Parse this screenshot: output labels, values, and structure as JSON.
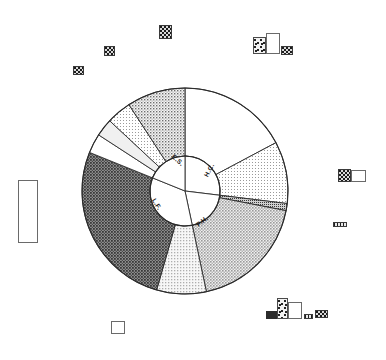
{
  "figure": {
    "title": "",
    "center": {
      "x": 185,
      "y": 191
    },
    "outer_radius": 103,
    "inner_radius": 35
  },
  "chart_data": {
    "type": "pie",
    "title": "",
    "xlabel": "",
    "ylabel": "",
    "legend_position": "none",
    "grid": false,
    "inner_ring": {
      "name": "inner",
      "labels": [
        "H.C.",
        "P.H.",
        "L.F.",
        "E.S."
      ],
      "start_angles_deg": [
        0,
        97,
        168,
        292
      ],
      "end_angles_deg": [
        97,
        168,
        292,
        360
      ],
      "values": [
        27,
        20,
        34,
        19
      ],
      "fills": [
        "white",
        "white",
        "white",
        "white"
      ],
      "label_positions": [
        {
          "label": "H.C.",
          "x": 209,
          "y": 170,
          "rotate": -62
        },
        {
          "label": "P.H.",
          "x": 202,
          "y": 221,
          "rotate": -38
        },
        {
          "label": "L.F.",
          "x": 157,
          "y": 204,
          "rotate": 58
        },
        {
          "label": "E.S.",
          "x": 178,
          "y": 160,
          "rotate": 42
        }
      ]
    },
    "outer_ring": {
      "name": "outer",
      "segments": [
        {
          "id": "hc-1",
          "parent": "H.C.",
          "start_angle_deg": 0,
          "end_angle_deg": 62,
          "value": 17,
          "fill": "white"
        },
        {
          "id": "hc-2",
          "parent": "H.C.",
          "start_angle_deg": 62,
          "end_angle_deg": 97,
          "value": 10,
          "fill": "light-dot"
        },
        {
          "id": "sliver",
          "parent": "P.H.",
          "start_angle_deg": 97,
          "end_angle_deg": 101,
          "value": 1,
          "fill": "dense-dot"
        },
        {
          "id": "ph-1",
          "parent": "P.H.",
          "start_angle_deg": 101,
          "end_angle_deg": 168,
          "value": 19,
          "fill": "mid-gray"
        },
        {
          "id": "lf-1",
          "parent": "L.F.",
          "start_angle_deg": 168,
          "end_angle_deg": 196,
          "value": 8,
          "fill": "light-gray"
        },
        {
          "id": "lf-2",
          "parent": "L.F.",
          "start_angle_deg": 196,
          "end_angle_deg": 292,
          "value": 26,
          "fill": "dark-gray"
        },
        {
          "id": "es-1",
          "parent": "E.S.",
          "start_angle_deg": 292,
          "end_angle_deg": 303,
          "value": 3,
          "fill": "white"
        },
        {
          "id": "es-2",
          "parent": "E.S.",
          "start_angle_deg": 303,
          "end_angle_deg": 313,
          "value": 3,
          "fill": "pale-gray"
        },
        {
          "id": "es-3",
          "parent": "E.S.",
          "start_angle_deg": 313,
          "end_angle_deg": 327,
          "value": 4,
          "fill": "light-dot"
        },
        {
          "id": "es-4",
          "parent": "E.S.",
          "start_angle_deg": 327,
          "end_angle_deg": 360,
          "value": 9,
          "fill": "mid-dot"
        }
      ]
    },
    "fill_colors": {
      "white": "#ffffff",
      "pale-gray": "#f0f0f0",
      "light-gray": "#d8d8d8",
      "light-dot": "#e3e3e3",
      "mid-dot": "#c8c8c8",
      "mid-gray": "#bdbdbd",
      "dense-dot": "#9a9a9a",
      "dark-gray": "#6e6e6e",
      "outline": "#2b2b2b"
    }
  },
  "artifacts": [
    {
      "name": "mark-top-right-large",
      "kind": "square-check",
      "x": 159,
      "y": 25,
      "w": 13,
      "h": 14
    },
    {
      "name": "mark-top-mid",
      "kind": "square-check",
      "x": 104,
      "y": 46,
      "w": 11,
      "h": 10
    },
    {
      "name": "mark-top-left-small",
      "kind": "square-check",
      "x": 73,
      "y": 66,
      "w": 11,
      "h": 9
    },
    {
      "name": "mark-bottom-left-box",
      "kind": "square-white",
      "x": 111,
      "y": 321,
      "w": 14,
      "h": 13
    },
    {
      "name": "mark-left-tall-box",
      "kind": "rect-white",
      "x": 18,
      "y": 180,
      "w": 20,
      "h": 63
    },
    {
      "name": "mark-right-bar",
      "kind": "bar-dark",
      "x": 333,
      "y": 222,
      "w": 14,
      "h": 5
    },
    {
      "name": "mark-right-patch",
      "kind": "square-check",
      "x": 338,
      "y": 169,
      "w": 13,
      "h": 13
    },
    {
      "name": "mark-right-box",
      "kind": "rect-white",
      "x": 351,
      "y": 170,
      "w": 15,
      "h": 12
    },
    {
      "name": "mark-tr-speck",
      "kind": "speck",
      "x": 253,
      "y": 37,
      "w": 13,
      "h": 17
    },
    {
      "name": "mark-tr-white",
      "kind": "rect-white",
      "x": 266,
      "y": 33,
      "w": 14,
      "h": 21
    },
    {
      "name": "mark-tr-small",
      "kind": "square-check",
      "x": 281,
      "y": 46,
      "w": 12,
      "h": 9
    },
    {
      "name": "mark-br-black",
      "kind": "bar-black",
      "x": 266,
      "y": 311,
      "w": 15,
      "h": 8
    },
    {
      "name": "mark-br-speck",
      "kind": "speck",
      "x": 277,
      "y": 298,
      "w": 11,
      "h": 21
    },
    {
      "name": "mark-br-white",
      "kind": "rect-white",
      "x": 288,
      "y": 302,
      "w": 14,
      "h": 17
    },
    {
      "name": "mark-br-dark",
      "kind": "bar-dark",
      "x": 304,
      "y": 314,
      "w": 9,
      "h": 5
    },
    {
      "name": "mark-br-box",
      "kind": "square-check",
      "x": 315,
      "y": 310,
      "w": 13,
      "h": 8
    }
  ]
}
